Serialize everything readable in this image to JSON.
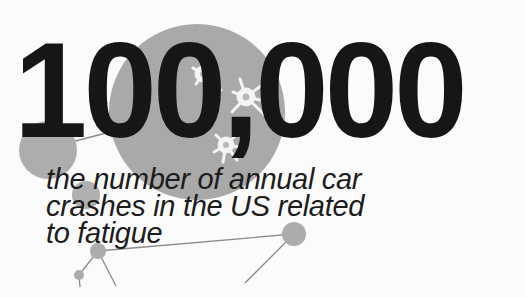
{
  "headline": {
    "number": "100,000"
  },
  "caption": {
    "lines": [
      "the number of annual car",
      "crashes in the US related",
      "to fatigue"
    ]
  },
  "colors": {
    "background": "#fbfbfb",
    "text": "#161616",
    "circle_fill": "#a9a9a9",
    "neuron": "#f4f4f4",
    "line": "#8a8a8a"
  },
  "icons": [
    "neuron-icon",
    "network-node-icon"
  ]
}
